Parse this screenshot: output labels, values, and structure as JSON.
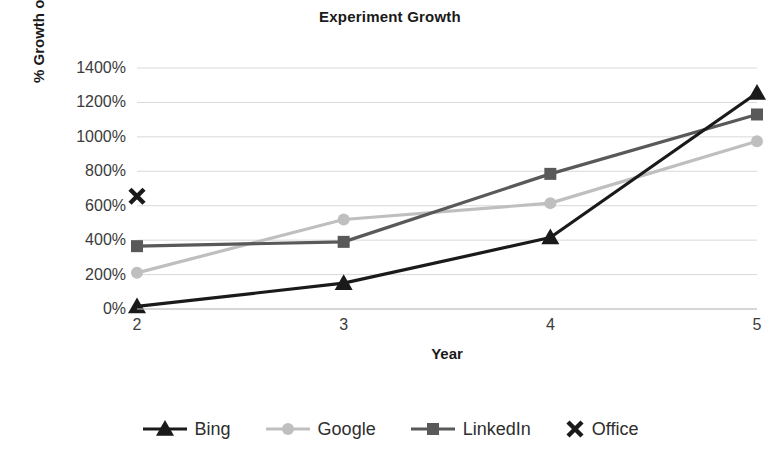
{
  "chart_data": {
    "type": "line",
    "title": "Experiment Growth",
    "xlabel": "Year",
    "ylabel": "% Growth over Year 1",
    "categories": [
      2,
      3,
      4,
      5
    ],
    "x_tick_labels": [
      "2",
      "3",
      "4",
      "5"
    ],
    "y_tick_labels": [
      "0%",
      "200%",
      "400%",
      "600%",
      "800%",
      "1000%",
      "1200%",
      "1400%"
    ],
    "y_tick_values": [
      0,
      200,
      400,
      600,
      800,
      1000,
      1200,
      1400
    ],
    "ylim": [
      0,
      1400
    ],
    "xlim": [
      2,
      5
    ],
    "grid": "horizontal",
    "legend_position": "bottom",
    "value_unit": "%",
    "series": [
      {
        "name": "Bing",
        "marker": "triangle",
        "color": "#1a1a1a",
        "x": [
          2,
          3,
          4,
          5
        ],
        "values": [
          15,
          150,
          415,
          1255
        ]
      },
      {
        "name": "Google",
        "marker": "circle",
        "color": "#bfbfbf",
        "x": [
          2,
          3,
          4,
          5
        ],
        "values": [
          210,
          520,
          615,
          975
        ]
      },
      {
        "name": "LinkedIn",
        "marker": "square",
        "color": "#595959",
        "x": [
          2,
          3,
          4,
          5
        ],
        "values": [
          365,
          390,
          785,
          1130
        ]
      },
      {
        "name": "Office",
        "marker": "x",
        "color": "#1a1a1a",
        "x": [
          2
        ],
        "values": [
          655
        ]
      }
    ],
    "colors": {
      "gridline": "#d9d9d9",
      "axis_line": "#bfbfbf",
      "tick_text": "#3b3b3b",
      "title_text": "#1a1a1a",
      "background": "#ffffff"
    }
  }
}
